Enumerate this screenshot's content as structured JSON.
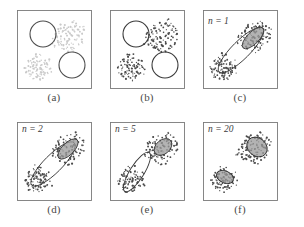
{
  "figure": {
    "background_color": "#ffffff",
    "panel_border_color": "#7a7a7a",
    "rows": 2,
    "cols": 3
  },
  "panels": [
    {
      "id": "a",
      "caption": "(a)",
      "tag": "",
      "point_color": "#c9c9c9",
      "description": "two faint gray point clusters with two initial circles",
      "circles": [
        {
          "cx": 26,
          "cy": 24,
          "r": 13,
          "filled": false,
          "stroke": "#4d4d4d"
        },
        {
          "cx": 55,
          "cy": 55,
          "r": 13,
          "filled": false,
          "stroke": "#4d4d4d"
        }
      ],
      "ellipses": []
    },
    {
      "id": "b",
      "caption": "(b)",
      "tag": "",
      "point_color": "#4a4a4a",
      "description": "same clusters rendered dark with two initial circles",
      "circles": [
        {
          "cx": 26,
          "cy": 24,
          "r": 13,
          "filled": false,
          "stroke": "#3a3a3a"
        },
        {
          "cx": 55,
          "cy": 55,
          "r": 13,
          "filled": false,
          "stroke": "#3a3a3a"
        }
      ],
      "ellipses": []
    },
    {
      "id": "c",
      "caption": "(c)",
      "tag": "n = 1",
      "point_color": "#4a4a4a",
      "description": "one long diagonal outlined ellipse plus one filled gray ellipse",
      "circles": [],
      "ellipses": [
        {
          "cx": 38,
          "cy": 40,
          "rx": 31,
          "ry": 9,
          "rot": -45,
          "fill": "none",
          "stroke": "#3a3a3a"
        },
        {
          "cx": 50,
          "cy": 28,
          "rx": 14,
          "ry": 6,
          "rot": -45,
          "fill": "#9a9a9a",
          "stroke": "#3a3a3a"
        }
      ]
    },
    {
      "id": "d",
      "caption": "(d)",
      "tag": "n = 2",
      "point_color": "#4a4a4a",
      "description": "long diagonal outlined ellipse with filled gray ellipse at upper right",
      "circles": [],
      "ellipses": [
        {
          "cx": 36,
          "cy": 42,
          "rx": 30,
          "ry": 9,
          "rot": -45,
          "fill": "none",
          "stroke": "#3a3a3a"
        },
        {
          "cx": 51,
          "cy": 27,
          "rx": 13,
          "ry": 6,
          "rot": -45,
          "fill": "#9a9a9a",
          "stroke": "#3a3a3a"
        }
      ]
    },
    {
      "id": "e",
      "caption": "(e)",
      "tag": "n = 5",
      "point_color": "#4a4a4a",
      "description": "elongated ellipse on lower-left cluster, compact ellipse on upper-right cluster",
      "circles": [],
      "ellipses": [
        {
          "cx": 27,
          "cy": 50,
          "rx": 23,
          "ry": 7,
          "rot": -58,
          "fill": "none",
          "stroke": "#3a3a3a"
        },
        {
          "cx": 53,
          "cy": 25,
          "rx": 10,
          "ry": 7,
          "rot": -40,
          "fill": "#9a9a9a",
          "stroke": "#3a3a3a"
        }
      ]
    },
    {
      "id": "f",
      "caption": "(f)",
      "tag": "n = 20",
      "point_color": "#4a4a4a",
      "description": "two small separate converged ellipses on each cluster",
      "circles": [],
      "ellipses": [
        {
          "cx": 22,
          "cy": 55,
          "rx": 6,
          "ry": 9,
          "rot": -65,
          "fill": "#9a9a9a",
          "stroke": "#2e2e2e"
        },
        {
          "cx": 54,
          "cy": 25,
          "rx": 9,
          "ry": 11,
          "rot": -50,
          "fill": "#9a9a9a",
          "stroke": "#2e2e2e"
        }
      ]
    }
  ],
  "chart_data": {
    "type": "scatter",
    "xlabel": "",
    "ylabel": "",
    "xlim": [
      0,
      74
    ],
    "ylim": [
      0,
      74
    ],
    "grid": false,
    "legend": "none",
    "iteration_labels": [
      "",
      "",
      "n = 1",
      "n = 2",
      "n = 5",
      "n = 20"
    ],
    "clusters": [
      {
        "name": "lower-left cluster",
        "center": [
          22,
          54
        ],
        "spread": [
          7,
          8
        ],
        "n_points": 60
      },
      {
        "name": "upper-right cluster",
        "center": [
          52,
          25
        ],
        "spread": [
          9,
          8
        ],
        "n_points": 70
      }
    ],
    "points_lower_left": [
      [
        14,
        62
      ],
      [
        17,
        60
      ],
      [
        19,
        63
      ],
      [
        21,
        58
      ],
      [
        23,
        61
      ],
      [
        16,
        56
      ],
      [
        20,
        54
      ],
      [
        24,
        57
      ],
      [
        26,
        60
      ],
      [
        13,
        58
      ],
      [
        18,
        66
      ],
      [
        22,
        64
      ],
      [
        25,
        63
      ],
      [
        15,
        52
      ],
      [
        19,
        50
      ],
      [
        23,
        52
      ],
      [
        27,
        55
      ],
      [
        12,
        64
      ],
      [
        21,
        67
      ],
      [
        25,
        68
      ],
      [
        17,
        48
      ],
      [
        20,
        46
      ],
      [
        24,
        49
      ],
      [
        28,
        51
      ],
      [
        29,
        58
      ],
      [
        11,
        60
      ],
      [
        14,
        54
      ],
      [
        18,
        57
      ],
      [
        22,
        59
      ],
      [
        26,
        65
      ],
      [
        30,
        62
      ],
      [
        9,
        57
      ],
      [
        13,
        50
      ],
      [
        16,
        62
      ],
      [
        19,
        55
      ],
      [
        23,
        66
      ],
      [
        27,
        61
      ],
      [
        31,
        55
      ],
      [
        12,
        55
      ],
      [
        15,
        65
      ],
      [
        20,
        61
      ],
      [
        24,
        54
      ],
      [
        28,
        57
      ],
      [
        10,
        62
      ],
      [
        17,
        53
      ],
      [
        21,
        51
      ],
      [
        25,
        59
      ],
      [
        29,
        64
      ],
      [
        33,
        59
      ],
      [
        16,
        69
      ],
      [
        22,
        70
      ],
      [
        26,
        52
      ],
      [
        30,
        54
      ],
      [
        8,
        59
      ],
      [
        12,
        67
      ],
      [
        18,
        44
      ],
      [
        24,
        45
      ],
      [
        34,
        63
      ],
      [
        32,
        50
      ],
      [
        11,
        52
      ]
    ],
    "points_upper_right": [
      [
        44,
        32
      ],
      [
        47,
        29
      ],
      [
        50,
        26
      ],
      [
        53,
        23
      ],
      [
        56,
        20
      ],
      [
        59,
        17
      ],
      [
        45,
        27
      ],
      [
        48,
        24
      ],
      [
        51,
        21
      ],
      [
        54,
        18
      ],
      [
        57,
        15
      ],
      [
        46,
        34
      ],
      [
        49,
        31
      ],
      [
        52,
        28
      ],
      [
        55,
        25
      ],
      [
        58,
        22
      ],
      [
        61,
        19
      ],
      [
        43,
        29
      ],
      [
        40,
        33
      ],
      [
        42,
        36
      ],
      [
        50,
        33
      ],
      [
        53,
        30
      ],
      [
        56,
        27
      ],
      [
        59,
        24
      ],
      [
        62,
        21
      ],
      [
        65,
        18
      ],
      [
        47,
        36
      ],
      [
        44,
        38
      ],
      [
        41,
        30
      ],
      [
        38,
        35
      ],
      [
        52,
        35
      ],
      [
        55,
        32
      ],
      [
        58,
        29
      ],
      [
        61,
        26
      ],
      [
        64,
        23
      ],
      [
        49,
        19
      ],
      [
        52,
        16
      ],
      [
        55,
        13
      ],
      [
        58,
        11
      ],
      [
        46,
        21
      ],
      [
        43,
        24
      ],
      [
        40,
        27
      ],
      [
        37,
        31
      ],
      [
        60,
        30
      ],
      [
        63,
        27
      ],
      [
        66,
        24
      ],
      [
        51,
        38
      ],
      [
        48,
        40
      ],
      [
        45,
        35
      ],
      [
        54,
        37
      ],
      [
        57,
        34
      ],
      [
        60,
        13
      ],
      [
        63,
        16
      ],
      [
        66,
        29
      ],
      [
        42,
        22
      ],
      [
        39,
        25
      ],
      [
        36,
        28
      ],
      [
        49,
        14
      ],
      [
        46,
        17
      ],
      [
        43,
        19
      ],
      [
        67,
        20
      ],
      [
        64,
        32
      ],
      [
        61,
        35
      ],
      [
        58,
        38
      ],
      [
        55,
        41
      ],
      [
        52,
        42
      ],
      [
        35,
        33
      ],
      [
        38,
        23
      ],
      [
        41,
        20
      ],
      [
        44,
        15
      ]
    ],
    "scatter_points_faint": true
  },
  "captions": {
    "a": "(a)",
    "b": "(b)",
    "c": "(c)",
    "d": "(d)",
    "e": "(e)",
    "f": "(f)"
  },
  "tags": {
    "c": "n = 1",
    "d": "n = 2",
    "e": "n = 5",
    "f": "n = 20"
  }
}
